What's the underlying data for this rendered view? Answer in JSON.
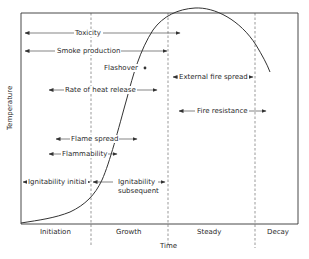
{
  "diagram": {
    "axes": {
      "x_label": "Time",
      "y_label": "Temperature"
    },
    "phases": [
      {
        "label": "Initiation"
      },
      {
        "label": "Growth"
      },
      {
        "label": "Steady"
      },
      {
        "label": "Decay"
      }
    ],
    "point_annotation": "Flashover",
    "spans": [
      {
        "label": "Toxicity"
      },
      {
        "label": "Smoke production"
      },
      {
        "label": "Rate of heat release"
      },
      {
        "label": "Flame spread"
      },
      {
        "label": "Flammability"
      },
      {
        "label": "Ignitability initial"
      },
      {
        "label_line1": "Ignitability",
        "label_line2": "subsequent"
      },
      {
        "label": "External fire spread"
      },
      {
        "label": "Fire resistance"
      }
    ],
    "colors": {
      "line": "#333333",
      "background": "#ffffff"
    }
  }
}
